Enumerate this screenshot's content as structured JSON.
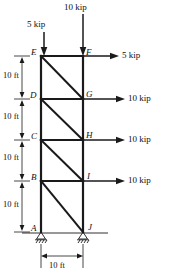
{
  "diagram": {
    "type": "structural-truss",
    "units": "ft / kip",
    "colors": {
      "line": "#1a1a1a",
      "text": "#111111",
      "background": "#ffffff"
    },
    "nodes": [
      {
        "id": "E",
        "label": "E",
        "x": 41,
        "y": 56,
        "label_dx": -9,
        "label_dy": -4
      },
      {
        "id": "F",
        "label": "F",
        "x": 83,
        "y": 56,
        "label_dx": 3,
        "label_dy": -4
      },
      {
        "id": "D",
        "label": "D",
        "x": 41,
        "y": 99,
        "label_dx": -9,
        "label_dy": -4
      },
      {
        "id": "G",
        "label": "G",
        "x": 83,
        "y": 99,
        "label_dx": 3,
        "label_dy": -4
      },
      {
        "id": "C",
        "label": "C",
        "x": 41,
        "y": 140,
        "label_dx": -9,
        "label_dy": -4
      },
      {
        "id": "H",
        "label": "H",
        "x": 83,
        "y": 140,
        "label_dx": 3,
        "label_dy": -4
      },
      {
        "id": "B",
        "label": "B",
        "x": 41,
        "y": 181,
        "label_dx": -9,
        "label_dy": -4
      },
      {
        "id": "I",
        "label": "I",
        "x": 83,
        "y": 181,
        "label_dx": 3,
        "label_dy": -4
      },
      {
        "id": "A",
        "label": "A",
        "x": 41,
        "y": 232,
        "label_dx": -9,
        "label_dy": -3
      },
      {
        "id": "J",
        "label": "J",
        "x": 83,
        "y": 232,
        "label_dx": 4,
        "label_dy": -3
      }
    ],
    "members": [
      {
        "from": "E",
        "to": "D",
        "kind": "chord-left"
      },
      {
        "from": "D",
        "to": "C",
        "kind": "chord-left"
      },
      {
        "from": "C",
        "to": "B",
        "kind": "chord-left"
      },
      {
        "from": "B",
        "to": "A",
        "kind": "chord-left"
      },
      {
        "from": "F",
        "to": "G",
        "kind": "chord-right"
      },
      {
        "from": "G",
        "to": "H",
        "kind": "chord-right"
      },
      {
        "from": "H",
        "to": "I",
        "kind": "chord-right"
      },
      {
        "from": "I",
        "to": "J",
        "kind": "chord-right"
      },
      {
        "from": "E",
        "to": "F",
        "kind": "strut"
      },
      {
        "from": "D",
        "to": "G",
        "kind": "strut"
      },
      {
        "from": "C",
        "to": "H",
        "kind": "strut"
      },
      {
        "from": "B",
        "to": "I",
        "kind": "strut"
      },
      {
        "from": "E",
        "to": "G",
        "kind": "diagonal"
      },
      {
        "from": "D",
        "to": "H",
        "kind": "diagonal"
      },
      {
        "from": "C",
        "to": "I",
        "kind": "diagonal"
      },
      {
        "from": "B",
        "to": "J",
        "kind": "diagonal"
      }
    ],
    "supports": [
      {
        "at": "A",
        "type": "pin-hatched",
        "x": 41,
        "y": 232
      },
      {
        "at": "J",
        "type": "pin-hatched",
        "x": 83,
        "y": 232
      }
    ],
    "ground_line": {
      "x1": 22,
      "x2": 108,
      "y": 233
    },
    "vertical_loads": [
      {
        "label": "5 kip",
        "magnitude": 5,
        "unit": "kip",
        "at": "E",
        "x": 44,
        "y_start": 32,
        "y_end": 55,
        "text_x": 27,
        "text_y": 20
      },
      {
        "label": "10 kip",
        "magnitude": 10,
        "unit": "kip",
        "at": "F",
        "x": 83,
        "y_start": 14,
        "y_end": 55,
        "text_x": 64,
        "text_y": 3
      }
    ],
    "horizontal_loads": [
      {
        "label": "5 kip",
        "magnitude": 5,
        "unit": "kip",
        "at": "F",
        "x_start": 84,
        "x_end": 118,
        "y": 56,
        "text_x": 122,
        "text_y": 51
      },
      {
        "label": "10 kip",
        "magnitude": 10,
        "unit": "kip",
        "at": "G",
        "x_start": 84,
        "x_end": 124,
        "y": 99,
        "text_x": 128,
        "text_y": 94
      },
      {
        "label": "10 kip",
        "magnitude": 10,
        "unit": "kip",
        "at": "H",
        "x_start": 84,
        "x_end": 124,
        "y": 140,
        "text_x": 128,
        "text_y": 135
      },
      {
        "label": "10 kip",
        "magnitude": 10,
        "unit": "kip",
        "at": "I",
        "x_start": 84,
        "x_end": 124,
        "y": 181,
        "text_x": 128,
        "text_y": 176
      }
    ],
    "vertical_dimensions": [
      {
        "label": "10 ft",
        "value": 10,
        "unit": "ft",
        "from": "E",
        "to": "D",
        "y_top": 56,
        "y_bot": 99,
        "x": 22,
        "text_x": 4,
        "text_y": 70
      },
      {
        "label": "10 ft",
        "value": 10,
        "unit": "ft",
        "from": "D",
        "to": "C",
        "y_top": 99,
        "y_bot": 140,
        "x": 22,
        "text_x": 4,
        "text_y": 112
      },
      {
        "label": "10 ft",
        "value": 10,
        "unit": "ft",
        "from": "C",
        "to": "B",
        "y_top": 140,
        "y_bot": 181,
        "x": 22,
        "text_x": 4,
        "text_y": 153
      },
      {
        "label": "10 ft",
        "value": 10,
        "unit": "ft",
        "from": "B",
        "to": "A",
        "y_top": 181,
        "y_bot": 232,
        "x": 22,
        "text_x": 4,
        "text_y": 199
      }
    ],
    "horizontal_dimension": {
      "label": "10 ft",
      "value": 10,
      "unit": "ft",
      "x_left": 41,
      "x_right": 83,
      "y": 256,
      "text_x": 48,
      "text_y": 261
    },
    "dimension_ticks": [
      {
        "y": 56
      },
      {
        "y": 99
      },
      {
        "y": 140
      },
      {
        "y": 181
      },
      {
        "y": 232
      }
    ]
  }
}
